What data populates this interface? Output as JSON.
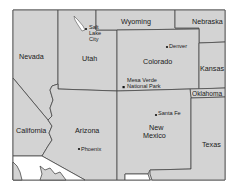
{
  "map": {
    "colors": {
      "land": "#d3d3d3",
      "border": "#4a4a4a",
      "foreign": "#ffffff",
      "label": "#1a1a1a"
    },
    "states": {
      "wyoming": "Wyoming",
      "nebraska": "Nebraska",
      "nevada": "Nevada",
      "utah": "Utah",
      "colorado": "Colorado",
      "kansas": "Kansas",
      "oklahoma": "Oklahoma",
      "california": "California",
      "arizona": "Arizona",
      "new_mexico_line1": "New",
      "new_mexico_line2": "Mexico",
      "texas": "Texas"
    },
    "places": {
      "salt_lake_line1": "Salt",
      "salt_lake_line2": "Lake",
      "salt_lake_line3": "City",
      "denver": "Denver",
      "mesa_verde_line1": "Mesa Verde",
      "mesa_verde_line2": "National Park",
      "santa_fe": "Santa Fe",
      "phoenix": "Phoenix"
    }
  }
}
